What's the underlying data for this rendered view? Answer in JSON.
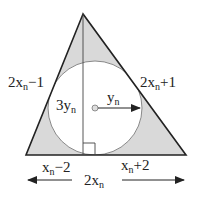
{
  "diagram": {
    "type": "triangle-incircle",
    "colors": {
      "shade": "#d9d9d9",
      "line": "#222222",
      "circle": "#888888"
    },
    "labels": {
      "left_side": {
        "main": "2x",
        "sub": "n",
        "tail": "−1"
      },
      "right_side": {
        "main": "2x",
        "sub": "n",
        "tail": "+1"
      },
      "altitude": {
        "main": "3y",
        "sub": "n"
      },
      "radius": {
        "main": "y",
        "sub": "n"
      },
      "base_left": {
        "main": "x",
        "sub": "n",
        "tail": "−2"
      },
      "base_right": {
        "main": "x",
        "sub": "n",
        "tail": "+2"
      },
      "base_total": {
        "main": "2x",
        "sub": "n"
      }
    }
  }
}
